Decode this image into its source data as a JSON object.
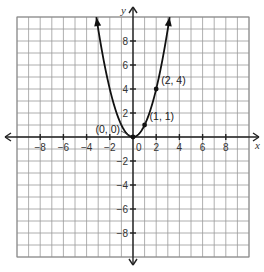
{
  "chart_data": {
    "type": "line",
    "title": "",
    "function": "y = x^2",
    "xlabel": "x",
    "ylabel": "y",
    "xlim": [
      -10,
      10
    ],
    "ylim": [
      -10,
      10
    ],
    "grid": true,
    "grid_step": 1,
    "x_ticks": [
      -8,
      -6,
      -4,
      -2,
      2,
      4,
      6,
      8
    ],
    "y_ticks": [
      -8,
      -6,
      -4,
      -2,
      2,
      4,
      6,
      8
    ],
    "x_tick_labels": [
      "−8",
      "−6",
      "−4",
      "−2",
      "2",
      "4",
      "6",
      "8"
    ],
    "y_tick_labels": [
      "−8",
      "−6",
      "−4",
      "−2",
      "2",
      "4",
      "6",
      "8"
    ],
    "origin_label": "0",
    "series": [
      {
        "name": "y = x^2",
        "x_range": [
          -3.16,
          3.16
        ],
        "arrows": true
      }
    ],
    "points": [
      {
        "x": 0,
        "y": 0,
        "label": "(0, 0)"
      },
      {
        "x": 1,
        "y": 1,
        "label": "(1, 1)"
      },
      {
        "x": 2,
        "y": 4,
        "label": "(2, 4)"
      }
    ]
  }
}
